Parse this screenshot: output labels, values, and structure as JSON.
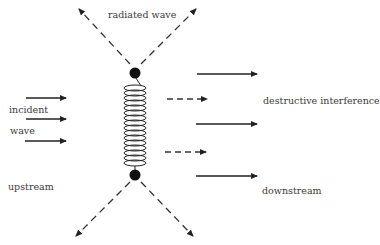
{
  "diagram": {
    "title": "",
    "labels": {
      "radiated_wave": "radiated wave",
      "incident": "incident",
      "wave": "wave",
      "destructive_interference": "destructive interference",
      "upstream": "upstream",
      "downstream": "downstream"
    },
    "elements": {
      "coil": "helical-spring-oscillator",
      "top_mass": "filled-circle",
      "bottom_mass": "filled-circle",
      "incident_arrows": 3,
      "downstream_solid_arrows": 3,
      "downstream_dashed_arrows": 2,
      "radiated_dashed_arrows": 4
    },
    "colors": {
      "ink": "#222222",
      "text": "#3a3a3a",
      "background": "#ffffff"
    }
  }
}
